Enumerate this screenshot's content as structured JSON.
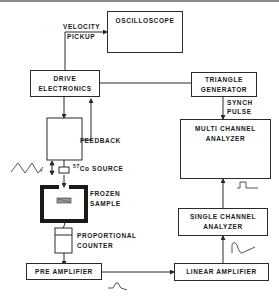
{
  "diagram": {
    "blocks": {
      "oscilloscope": {
        "label": "OSCILLOSCOPE"
      },
      "drive_electronics": {
        "line1": "DRIVE",
        "line2": "ELECTRONICS"
      },
      "triangle_generator": {
        "line1": "TRIANGLE",
        "line2": "GENERATOR"
      },
      "multi_channel_analyzer": {
        "line1": "MULTI CHANNEL",
        "line2": "ANALYZER"
      },
      "single_channel_analyzer": {
        "line1": "SINGLE CHANNEL",
        "line2": "ANALYZER"
      },
      "pre_amplifier": {
        "label": "PRE AMPLIFIER"
      },
      "linear_amplifier": {
        "label": "LINEAR AMPLIFIER"
      }
    },
    "labels": {
      "velocity_pickup_1": "VELOCITY",
      "velocity_pickup_2": "PICKUP",
      "feedback": "FEEDBACK",
      "source_sup": "57",
      "source": "Co SOURCE",
      "frozen_sample_1": "FROZEN",
      "frozen_sample_2": "SAMPLE",
      "proportional_counter_1": "PROPORTIONAL",
      "proportional_counter_2": "COUNTER",
      "synch_pulse_1": "SYNCH",
      "synch_pulse_2": "PULSE"
    },
    "colors": {
      "line": "#2a2a2a",
      "background": "#ffffff"
    }
  }
}
